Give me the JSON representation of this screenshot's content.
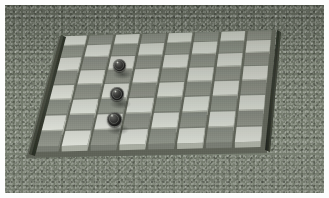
{
  "scene": {
    "title": "Checkerboard on gravel surface",
    "description": "Perspective view of an 8x8 raised-tile checkerboard resting on a mottled gray-green gravel ground, with dark rails along the left and right board edges and three dark round game pieces.",
    "image_width": 329,
    "image_height": 198,
    "photo_border_color": "#ffffff",
    "photo_border_width": 5
  },
  "ground": {
    "name": "gravel-ground",
    "base_color": "#6e7468",
    "speckle_light": "#e8ece2",
    "speckle_dark": "#2b2f26",
    "texture": "speckled gravel"
  },
  "board": {
    "name": "checkerboard",
    "rows": 8,
    "columns": 8,
    "light_square_color": "#d7d9d2",
    "light_square_color_alt": "#c7cac1",
    "dark_square_color": "#8b8f86",
    "dark_square_color_alt": "#7c8077",
    "tile_side_color": "#a2a69c",
    "tile_front_color": "#9a9e94",
    "grout_color": "#5f6459",
    "raised_tiles": true,
    "corners": {
      "back_left": [
        57,
        33
      ],
      "back_right": [
        268,
        27
      ],
      "front_right": [
        257,
        143
      ],
      "front_left": [
        26,
        148
      ]
    }
  },
  "rails": [
    {
      "name": "left-rail",
      "color": "#34382f",
      "highlight_color": "#555a4c",
      "top_point": [
        57,
        31
      ],
      "bottom_point": [
        25,
        150
      ]
    },
    {
      "name": "right-rail",
      "color": "#2e3229",
      "highlight_color": "#4e5346",
      "top_point": [
        270,
        26
      ],
      "bottom_point": [
        259,
        145
      ]
    }
  ],
  "pieces": [
    {
      "name": "checker-piece-1",
      "index": 1,
      "color": "#1d1d1c",
      "rim_color": "#9aa093",
      "highlight_color": "#ebf0e6",
      "center_x": 119,
      "center_y": 65,
      "diameter": 13,
      "board_row": 2,
      "board_column": 3
    },
    {
      "name": "checker-piece-2",
      "index": 2,
      "color": "#1d1d1c",
      "rim_color": "#9aa093",
      "highlight_color": "#ebf0e6",
      "center_x": 117,
      "center_y": 94,
      "diameter": 14,
      "board_row": 4,
      "board_column": 3
    },
    {
      "name": "checker-piece-3",
      "index": 3,
      "color": "#1d1d1c",
      "rim_color": "#9aa093",
      "highlight_color": "#ebf0e6",
      "center_x": 114,
      "center_y": 119,
      "diameter": 15,
      "board_row": 6,
      "board_column": 3
    }
  ],
  "lighting": {
    "direction": "upper-left",
    "vignette": true
  }
}
